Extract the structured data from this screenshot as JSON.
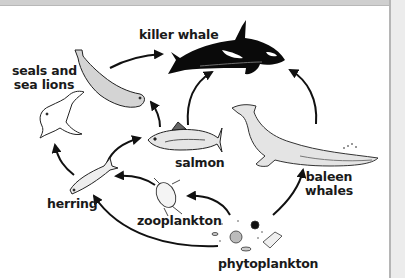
{
  "diagram": {
    "type": "marine food web",
    "organisms": [
      {
        "id": "killer_whale",
        "label": "killer whale"
      },
      {
        "id": "seals",
        "label_line1": "seals and",
        "label_line2": "sea lions"
      },
      {
        "id": "salmon",
        "label": "salmon"
      },
      {
        "id": "baleen_whales",
        "label_line1": "baleen",
        "label_line2": "whales"
      },
      {
        "id": "herring",
        "label": "herring"
      },
      {
        "id": "zooplankton",
        "label": "zooplankton"
      },
      {
        "id": "phytoplankton",
        "label": "phytoplankton"
      }
    ],
    "arrows": [
      {
        "from": "phytoplankton",
        "to": "zooplankton"
      },
      {
        "from": "phytoplankton",
        "to": "herring"
      },
      {
        "from": "phytoplankton",
        "to": "baleen_whales"
      },
      {
        "from": "zooplankton",
        "to": "herring"
      },
      {
        "from": "herring",
        "to": "salmon"
      },
      {
        "from": "herring",
        "to": "seals"
      },
      {
        "from": "salmon",
        "to": "seals"
      },
      {
        "from": "salmon",
        "to": "killer_whale"
      },
      {
        "from": "seals",
        "to": "killer_whale"
      },
      {
        "from": "baleen_whales",
        "to": "killer_whale"
      }
    ],
    "colors": {
      "ink": "#111111",
      "seal_fill": "#d4d4d4",
      "whale_fill": "#e4e4e4",
      "background": "#ffffff",
      "frame": "#cfcfcf"
    }
  }
}
